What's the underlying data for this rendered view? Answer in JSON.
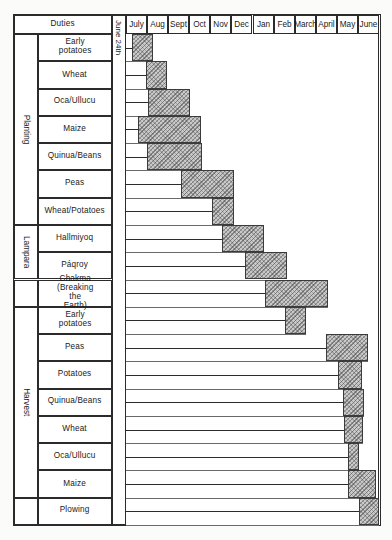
{
  "figure": {
    "duties_header": "Duties",
    "start_marker": "June 24th",
    "months": [
      "July",
      "Aug",
      "Sept",
      "Oct",
      "Nov",
      "Dec",
      "Jan",
      "Feb",
      "March",
      "April",
      "May",
      "June"
    ],
    "groups": [
      {
        "label": "Planting",
        "span": [
          0,
          6
        ]
      },
      {
        "label": "Lampara",
        "span": [
          7,
          8
        ]
      },
      {
        "label": "",
        "span": [
          9,
          9
        ]
      },
      {
        "label": "Harvest",
        "span": [
          10,
          16
        ]
      },
      {
        "label": "",
        "span": [
          17,
          17
        ]
      }
    ],
    "rows": [
      {
        "label": "Early potatoes"
      },
      {
        "label": "Wheat"
      },
      {
        "label": "Oca/Ullucu"
      },
      {
        "label": "Maize"
      },
      {
        "label": "Quinua/Beans"
      },
      {
        "label": "Peas"
      },
      {
        "label": "Wheat/Potatoes"
      },
      {
        "label": "Hallmiyoq"
      },
      {
        "label": "Páqroy"
      },
      {
        "label": "Chakma\n(Breaking the Earth)"
      },
      {
        "label": "Early potatoes"
      },
      {
        "label": "Peas"
      },
      {
        "label": "Potatoes"
      },
      {
        "label": "Quinua/Beans"
      },
      {
        "label": "Wheat"
      },
      {
        "label": "Oca/Ullucu"
      },
      {
        "label": "Maize"
      },
      {
        "label": "Plowing"
      }
    ]
  },
  "chart_data": {
    "type": "bar",
    "xlabel": "Duties",
    "ylabel": "Month",
    "orientation": "gantt-vertical",
    "axis_months": [
      "July",
      "Aug",
      "Sept",
      "Oct",
      "Nov",
      "Dec",
      "Jan",
      "Feb",
      "March",
      "April",
      "May",
      "June"
    ],
    "axis_start_marker": "June 24th",
    "grid": true,
    "legend": "none",
    "groups": [
      "Planting",
      "Lampara",
      "Chakma (Breaking the Earth)",
      "Harvest",
      "Plowing"
    ],
    "note": "Each task bar spans the month range in which that duty is performed; start value 0 = June 24th, 1 = start of July, 12 = end of June.",
    "tasks": [
      {
        "group": "Planting",
        "task": "Early potatoes",
        "start": 0.3,
        "end": 1.3
      },
      {
        "group": "Planting",
        "task": "Wheat",
        "start": 0.95,
        "end": 1.95
      },
      {
        "group": "Planting",
        "task": "Oca/Ullucu",
        "start": 1.05,
        "end": 3.05
      },
      {
        "group": "Planting",
        "task": "Maize",
        "start": 0.55,
        "end": 3.55
      },
      {
        "group": "Planting",
        "task": "Quinua/Beans",
        "start": 1.0,
        "end": 3.6
      },
      {
        "group": "Planting",
        "task": "Peas",
        "start": 2.6,
        "end": 5.1
      },
      {
        "group": "Planting",
        "task": "Wheat/Potatoes",
        "start": 4.1,
        "end": 5.1
      },
      {
        "group": "Lampara",
        "task": "Hallmiyoq",
        "start": 4.55,
        "end": 6.55
      },
      {
        "group": "Lampara",
        "task": "Páqroy",
        "start": 5.65,
        "end": 7.65
      },
      {
        "group": "Chakma",
        "task": "Chakma (Breaking the Earth)",
        "start": 6.6,
        "end": 9.6
      },
      {
        "group": "Harvest",
        "task": "Early potatoes",
        "start": 7.55,
        "end": 8.55
      },
      {
        "group": "Harvest",
        "task": "Peas",
        "start": 9.5,
        "end": 11.5
      },
      {
        "group": "Harvest",
        "task": "Potatoes",
        "start": 10.05,
        "end": 11.2
      },
      {
        "group": "Harvest",
        "task": "Quinua/Beans",
        "start": 10.3,
        "end": 11.3
      },
      {
        "group": "Harvest",
        "task": "Wheat",
        "start": 10.35,
        "end": 11.25
      },
      {
        "group": "Harvest",
        "task": "Oca/Ullucu",
        "start": 10.55,
        "end": 11.05
      },
      {
        "group": "Harvest",
        "task": "Maize",
        "start": 10.55,
        "end": 11.85
      },
      {
        "group": "Plowing",
        "task": "Plowing",
        "start": 11.05,
        "end": 12.0
      }
    ]
  }
}
